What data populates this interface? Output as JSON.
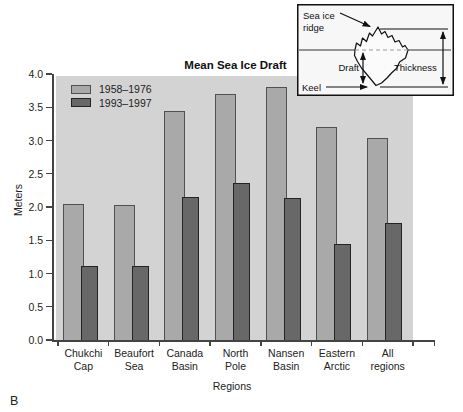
{
  "figure_label": "B",
  "colors": {
    "plot_background": "#d3d3d3",
    "series1_fill": "#a9a9a9",
    "series1_border": "#505050",
    "series2_fill": "#686868",
    "series2_border": "#242424",
    "axis": "#444444",
    "inset_background": "#f7f7f7",
    "inset_border": "#111111"
  },
  "chart_data": {
    "type": "bar",
    "title": "Mean Sea Ice Draft",
    "xlabel": "Regions",
    "ylabel": "Meters",
    "ylim": [
      0.0,
      4.0
    ],
    "ytick_step": 0.5,
    "yticks": [
      "0.0",
      "0.5",
      "1.0",
      "1.5",
      "2.0",
      "2.5",
      "3.0",
      "3.5",
      "4.0"
    ],
    "grid": false,
    "legend_position": "upper-left-inside",
    "categories": [
      "Chukchi Cap",
      "Beaufort Sea",
      "Canada Basin",
      "North Pole",
      "Nansen Basin",
      "Eastern Arctic",
      "All regions"
    ],
    "categories_lines": [
      [
        "Chukchi",
        "Cap"
      ],
      [
        "Beaufort",
        "Sea"
      ],
      [
        "Canada",
        "Basin"
      ],
      [
        "North",
        "Pole"
      ],
      [
        "Nansen",
        "Basin"
      ],
      [
        "Eastern",
        "Arctic"
      ],
      [
        "All",
        "regions"
      ]
    ],
    "series": [
      {
        "name": "1958–1976",
        "values": [
          2.05,
          2.03,
          3.44,
          3.7,
          3.81,
          3.21,
          3.04
        ]
      },
      {
        "name": "1993–1997",
        "values": [
          1.11,
          1.12,
          2.15,
          2.36,
          2.13,
          1.45,
          1.76
        ]
      }
    ]
  },
  "inset": {
    "label_sea_ice_ridge_line1": "Sea ice",
    "label_sea_ice_ridge_line2": "ridge",
    "label_draft": "Draft",
    "label_thickness": "Thickness",
    "label_keel": "Keel"
  }
}
